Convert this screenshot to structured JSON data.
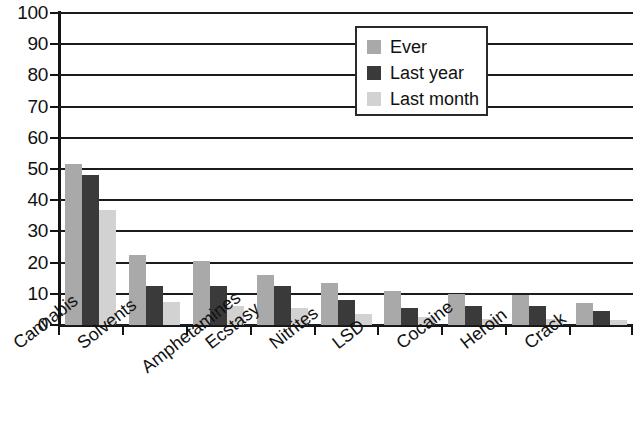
{
  "chart_data": {
    "type": "bar",
    "title": "",
    "xlabel": "",
    "ylabel": "",
    "ylim": [
      0,
      100
    ],
    "ytick_step": 10,
    "grid": true,
    "legend_position": "top-right-inside",
    "categories": [
      "Cannabis",
      "Solvents",
      "Amphetamines",
      "Ecstasy",
      "Nitrites",
      "LSD",
      "Cocaine",
      "Heroin",
      "Crack"
    ],
    "yticks": [
      "0",
      "10",
      "20",
      "30",
      "40",
      "50",
      "60",
      "70",
      "80",
      "90",
      "100"
    ],
    "series": [
      {
        "name": "Ever",
        "color": "#a9a9a9",
        "values": [
          51.5,
          22.5,
          20.5,
          16,
          13.5,
          11,
          10,
          9.5,
          7
        ]
      },
      {
        "name": "Last year",
        "color": "#3a3a3a",
        "values": [
          48,
          12.5,
          12.5,
          12.5,
          8,
          5.5,
          6,
          6,
          4.5
        ]
      },
      {
        "name": "Last month",
        "color": "#d2d2d2",
        "values": [
          37,
          7.5,
          6,
          5.5,
          3.5,
          2.5,
          2,
          2,
          1.5
        ]
      }
    ]
  }
}
